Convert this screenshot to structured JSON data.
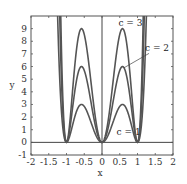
{
  "chart_data": {
    "type": "line",
    "title": "",
    "xlabel": "x",
    "ylabel": "y",
    "xlim": [
      -2,
      2
    ],
    "ylim": [
      -1,
      10
    ],
    "xticks": [
      -2,
      -1.5,
      -1,
      -0.5,
      0,
      0.5,
      1,
      1.5,
      2
    ],
    "xtick_labels": [
      "-2",
      "-1.5",
      "-1",
      "-0.5",
      "0",
      "0.5",
      "1",
      "1.5",
      "2"
    ],
    "yticks": [
      -1,
      0,
      1,
      2,
      3,
      4,
      5,
      6,
      7,
      8,
      9
    ],
    "ytick_labels": [
      "-1",
      "0",
      "1",
      "2",
      "3",
      "4",
      "5",
      "6",
      "7",
      "8",
      "9"
    ],
    "grid": false,
    "legend": "none",
    "reference_lines": {
      "x0": true,
      "y0": true
    },
    "series": [
      {
        "name": "c = 1",
        "param_c": 1,
        "zeros": [
          -1,
          0,
          1
        ],
        "peaks": [
          {
            "x": -0.58,
            "y": 3
          },
          {
            "x": 0.58,
            "y": 3
          }
        ]
      },
      {
        "name": "c = 2",
        "param_c": 2,
        "zeros": [
          -1,
          0,
          1
        ],
        "peaks": [
          {
            "x": -0.58,
            "y": 6
          },
          {
            "x": 0.58,
            "y": 6
          }
        ]
      },
      {
        "name": "c = 3",
        "param_c": 3,
        "zeros": [
          -1,
          0,
          1
        ],
        "peaks": [
          {
            "x": -0.58,
            "y": 9
          },
          {
            "x": 0.58,
            "y": 9
          }
        ]
      }
    ],
    "annotations": [
      {
        "text": "c = 3",
        "x": 0.8,
        "y": 9.2
      },
      {
        "text": "c = 2",
        "x": 1.55,
        "y": 7.2,
        "arrow_to": {
          "x": 0.62,
          "y": 5.9
        }
      },
      {
        "text": "c = 1",
        "x": 0.75,
        "y": 0.6
      }
    ]
  }
}
